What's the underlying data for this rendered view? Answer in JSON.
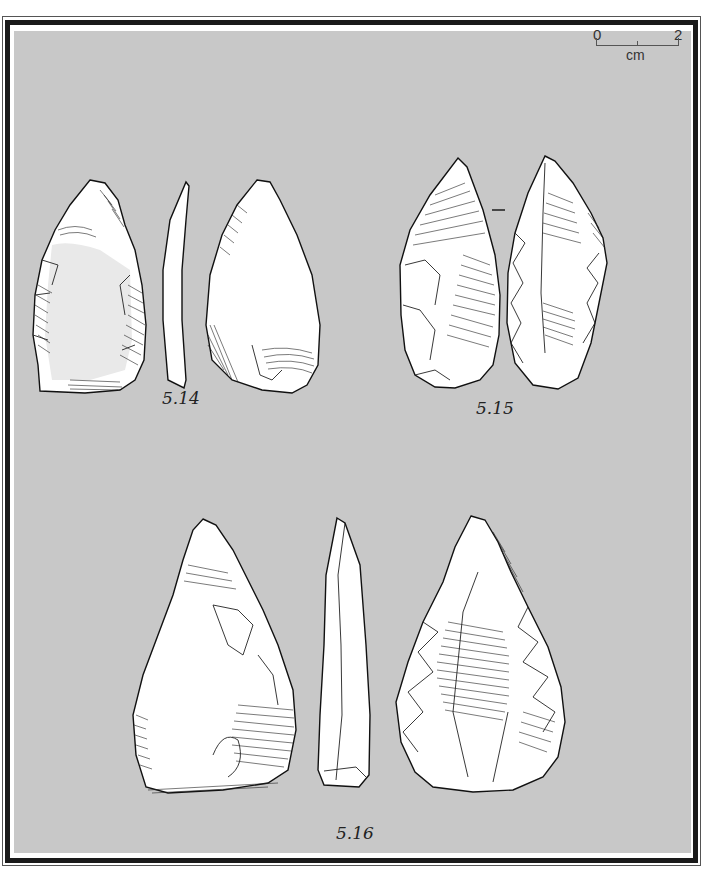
{
  "plate": {
    "background_color": "#c8c8c8",
    "frame_color": "#1a1a1a",
    "scale_bar": {
      "start_label": "0",
      "end_label": "2",
      "unit_label": "cm"
    },
    "figures": [
      {
        "id": "fig-5-14",
        "label": "5.14",
        "views": [
          "dorsal",
          "profile",
          "ventral"
        ]
      },
      {
        "id": "fig-5-15",
        "label": "5.15",
        "views": [
          "ventral",
          "dorsal"
        ],
        "separator": "–"
      },
      {
        "id": "fig-5-16",
        "label": "5.16",
        "views": [
          "ventral",
          "profile",
          "dorsal"
        ]
      }
    ]
  }
}
